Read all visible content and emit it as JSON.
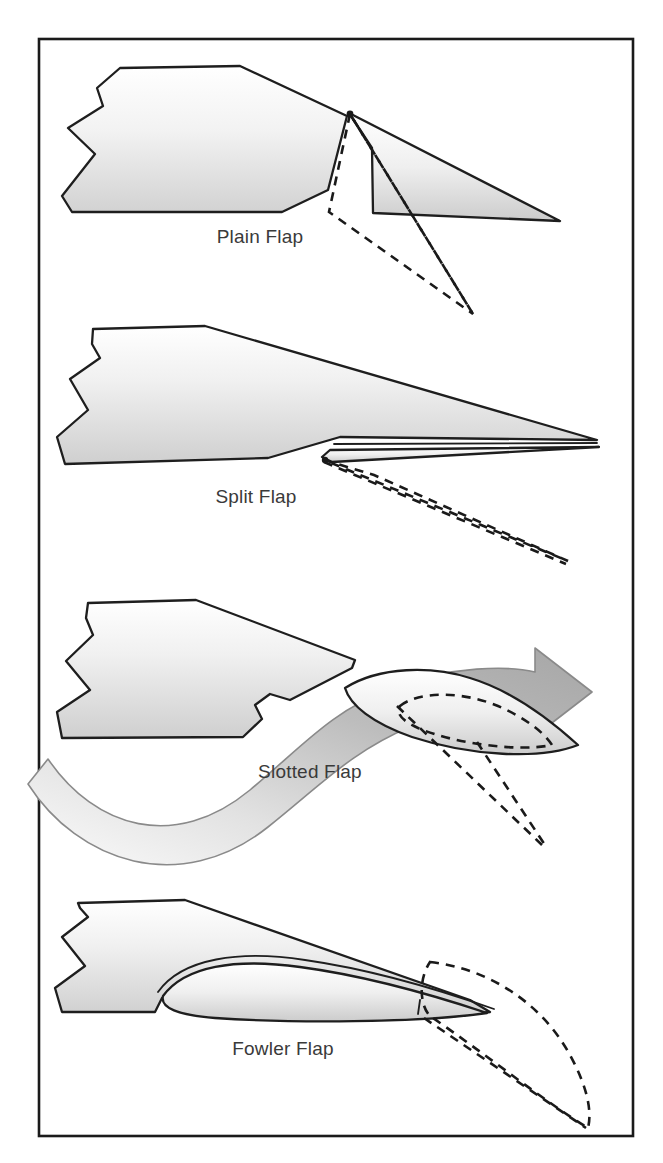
{
  "figure": {
    "border_color": "#1a1a1a",
    "background_color": "#ffffff",
    "outline_color": "#1e1e1e",
    "label_color": "#3a3a3a",
    "flow_arrow_color": "#a8a8a8",
    "dashed_color": "#1a1a1a",
    "wing_fill_top": "#ffffff",
    "wing_fill_bottom": "#d4d4d4"
  },
  "panels": [
    {
      "id": "plain-flap",
      "label": "Plain Flap",
      "label_x": 260,
      "label_y": 243,
      "description": "Wing section with hinged trailing-edge flap shown retracted in solid outline and deflected downward in dashed outline.",
      "has_flow_arrow": false
    },
    {
      "id": "split-flap",
      "label": "Split Flap",
      "label_x": 256,
      "label_y": 503,
      "description": "Wing section whose lower aft surface hinges downward; deflected position shown dashed.",
      "has_flow_arrow": false
    },
    {
      "id": "slotted-flap",
      "label": "Slotted Flap",
      "label_x": 310,
      "label_y": 778,
      "description": "Wing section with a separate flap airfoil forming a slot; a curved airflow ribbon passes through the slot and over the flap.",
      "has_flow_arrow": true
    },
    {
      "id": "fowler-flap",
      "label": "Fowler Flap",
      "label_x": 283,
      "label_y": 1055,
      "description": "Wing section with flap stowed within the lower aft wing; dashed outline shows it translated aft and deflected down.",
      "has_flow_arrow": false
    }
  ]
}
